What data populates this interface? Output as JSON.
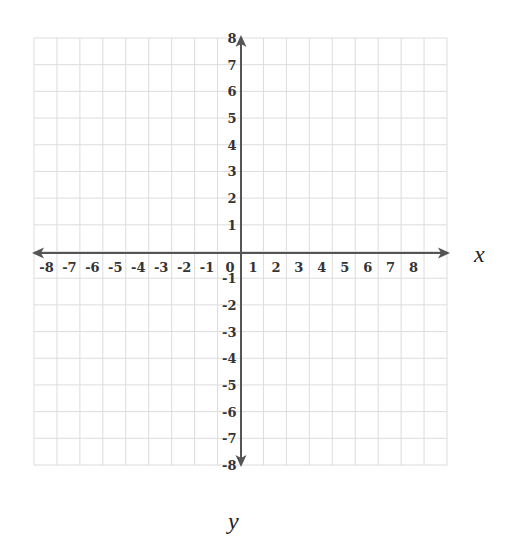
{
  "chart_data": {
    "type": "coordinate-plane",
    "title": "",
    "xlabel": "x",
    "ylabel": "y",
    "xlim": [
      -9,
      9
    ],
    "ylim": [
      -8,
      8
    ],
    "grid": true,
    "x_ticks": [
      -8,
      -7,
      -6,
      -5,
      -4,
      -3,
      -2,
      -1,
      0,
      1,
      2,
      3,
      4,
      5,
      6,
      7,
      8
    ],
    "y_ticks": [
      -8,
      -7,
      -6,
      -5,
      -4,
      -3,
      -2,
      -1,
      1,
      2,
      3,
      4,
      5,
      6,
      7,
      8
    ],
    "x_tick_labels": [
      "-8",
      "-7",
      "-6",
      "-5",
      "-4",
      "-3",
      "-2",
      "-1",
      "0",
      "1",
      "2",
      "3",
      "4",
      "5",
      "6",
      "7",
      "8"
    ],
    "y_tick_labels": [
      "8",
      "7",
      "6",
      "5",
      "4",
      "3",
      "2",
      "1",
      "-1",
      "-2",
      "-3",
      "-4",
      "-5",
      "-6",
      "-7",
      "-8"
    ],
    "arrows": [
      "x-positive",
      "x-negative",
      "y-positive",
      "y-negative"
    ],
    "data_points": []
  },
  "labels": {
    "x_axis": "x",
    "y_axis": "y"
  },
  "colors": {
    "grid": "#dcdcdc",
    "axis": "#555555",
    "text": "#333333"
  }
}
